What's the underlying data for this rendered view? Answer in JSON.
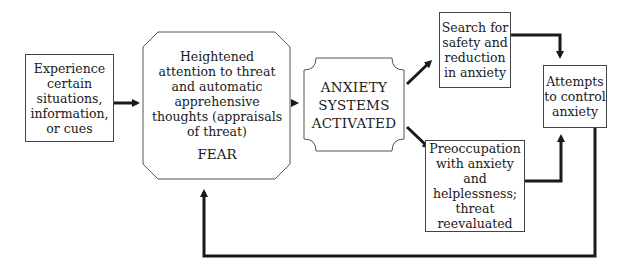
{
  "diagram": {
    "nodes": {
      "experience": {
        "lines": [
          "Experience",
          "certain",
          "situations,",
          "information,",
          "or cues"
        ]
      },
      "attention": {
        "lines": [
          "Heightened",
          "attention to threat",
          "and automatic",
          "apprehensive",
          "thoughts (appraisals",
          "of threat)"
        ],
        "label": "FEAR"
      },
      "activated": {
        "lines": [
          "ANXIETY",
          "SYSTEMS",
          "ACTIVATED"
        ]
      },
      "search": {
        "lines": [
          "Search for",
          "safety and",
          "reduction",
          "in anxiety"
        ]
      },
      "preoccupation": {
        "lines": [
          "Preoccupation",
          "with anxiety and",
          "helplessness;",
          "threat",
          "reevaluated"
        ]
      },
      "control": {
        "lines": [
          "Attempts",
          "to control",
          "anxiety"
        ]
      }
    },
    "edges": [
      {
        "from": "experience",
        "to": "attention"
      },
      {
        "from": "attention",
        "to": "activated"
      },
      {
        "from": "activated",
        "to": "search"
      },
      {
        "from": "activated",
        "to": "preoccupation"
      },
      {
        "from": "search",
        "to": "control"
      },
      {
        "from": "preoccupation",
        "to": "control"
      },
      {
        "from": "control",
        "to": "attention",
        "label": "feedback loop"
      }
    ],
    "colors": {
      "line": "#1a1a1a",
      "border": "#444444",
      "background": "#ffffff"
    }
  }
}
